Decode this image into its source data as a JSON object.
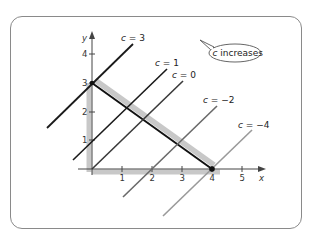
{
  "diagram": {
    "axes": {
      "x_label": "x",
      "y_label": "y",
      "x_ticks": [
        "1",
        "2",
        "3",
        "4",
        "5"
      ],
      "y_ticks": [
        "1",
        "2",
        "3",
        "4"
      ]
    },
    "callout": {
      "text_var": "c",
      "text_rest": " increases"
    },
    "level_lines": [
      {
        "label_var": "c",
        "label_rest": " = 3",
        "c": 3,
        "color": "#1a1a1a"
      },
      {
        "label_var": "c",
        "label_rest": " = 1",
        "c": 1,
        "color": "#1a1a1a"
      },
      {
        "label_var": "c",
        "label_rest": " = 0",
        "c": 0,
        "color": "#3a3a3a"
      },
      {
        "label_var": "c",
        "label_rest": " = −2",
        "c": -2,
        "color": "#6a6a6a"
      },
      {
        "label_var": "c",
        "label_rest": " = −4",
        "c": -4,
        "color": "#9a9a9a"
      }
    ],
    "feasible_region": {
      "vertices": [
        [
          0,
          0
        ],
        [
          4,
          0
        ],
        [
          0,
          3
        ]
      ],
      "highlight_color": "#c8c8c8",
      "boundary_color": "#111111"
    },
    "optimal_points": [
      [
        0,
        3
      ],
      [
        4,
        0
      ]
    ]
  }
}
